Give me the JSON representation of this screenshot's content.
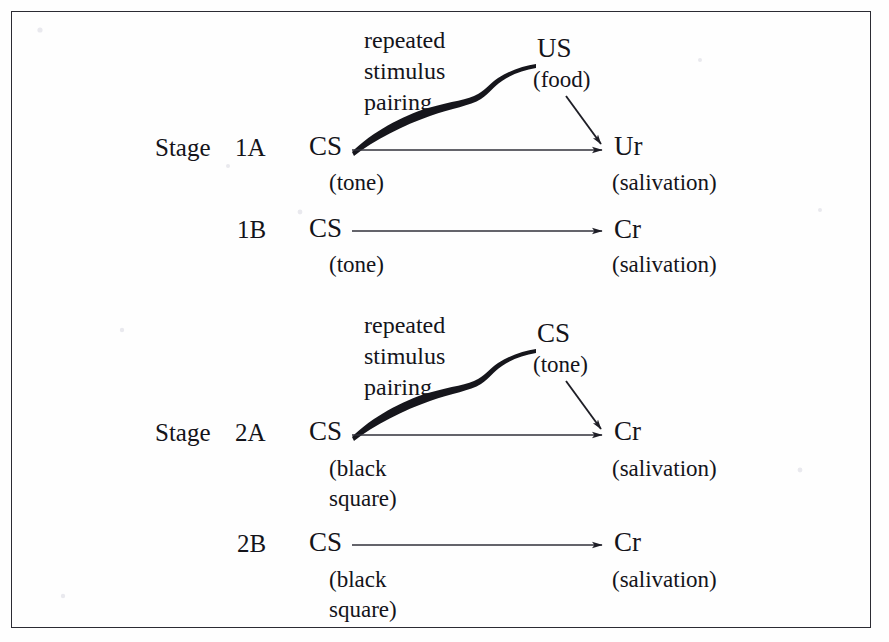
{
  "figure": {
    "frame_color": "#2b2b33",
    "ink_color": "#14141a",
    "background_color": "#fefefe"
  },
  "rows": {
    "stage1a": {
      "stage_label": "Stage",
      "row_label": "1A",
      "source_term": "CS",
      "source_paren_line1": "(tone)",
      "source_paren_line2": "",
      "note_line1": "repeated",
      "note_line2": "stimulus",
      "note_line3": "pairing",
      "curve_term": "US",
      "curve_paren": "(food)",
      "target_term": "Ur",
      "target_paren": "(salivation)"
    },
    "stage1b": {
      "stage_label": "",
      "row_label": "1B",
      "source_term": "CS",
      "source_paren_line1": "(tone)",
      "source_paren_line2": "",
      "target_term": "Cr",
      "target_paren": "(salivation)"
    },
    "stage2a": {
      "stage_label": "Stage",
      "row_label": "2A",
      "source_term": "CS",
      "source_paren_line1": "(black",
      "source_paren_line2": "square)",
      "note_line1": "repeated",
      "note_line2": "stimulus",
      "note_line3": "pairing",
      "curve_term": "CS",
      "curve_paren": "(tone)",
      "target_term": "Cr",
      "target_paren": "(salivation)"
    },
    "stage2b": {
      "stage_label": "",
      "row_label": "2B",
      "source_term": "CS",
      "source_paren_line1": "(black",
      "source_paren_line2": "square)",
      "target_term": "Cr",
      "target_paren": "(salivation)"
    }
  },
  "icons": {
    "arrow_right": "arrow-right-icon",
    "arrow_diagonal": "arrow-diagonal-down-right-icon",
    "pairing_curve": "pairing-curve-icon"
  }
}
